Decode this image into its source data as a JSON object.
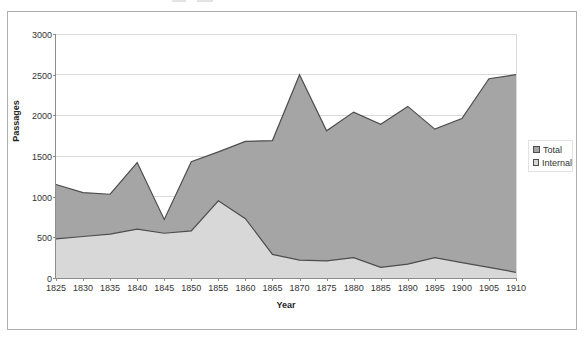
{
  "chart_data": {
    "type": "area",
    "title": "",
    "xlabel": "Year",
    "ylabel": "Passages",
    "ylim": [
      0,
      3000
    ],
    "yticks": [
      0,
      500,
      1000,
      1500,
      2000,
      2500,
      3000
    ],
    "grid": true,
    "legend_position": "right",
    "categories": [
      1825,
      1830,
      1835,
      1840,
      1845,
      1850,
      1855,
      1860,
      1865,
      1870,
      1875,
      1880,
      1885,
      1890,
      1895,
      1900,
      1905,
      1910
    ],
    "series": [
      {
        "name": "Total",
        "color": "#a5a5a5",
        "values": [
          1150,
          1050,
          1030,
          1420,
          720,
          1430,
          1550,
          1680,
          1690,
          2500,
          1810,
          2040,
          1890,
          2110,
          1830,
          1960,
          2450,
          2500
        ]
      },
      {
        "name": "Internal",
        "color": "#d8d8d8",
        "values": [
          480,
          510,
          540,
          600,
          550,
          580,
          950,
          730,
          290,
          220,
          210,
          250,
          130,
          170,
          250,
          190,
          130,
          70
        ]
      }
    ],
    "colors": {
      "outline": "#4d4d4d",
      "gridline": "#d9d9d9",
      "axis": "#8c8c8c",
      "plot_background": "#ffffff",
      "frame_border": "#aeaeae",
      "tick_text": "#333333"
    }
  }
}
